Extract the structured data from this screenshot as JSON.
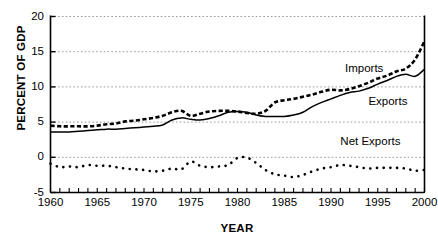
{
  "chart_data": {
    "type": "line",
    "title": "",
    "xlabel": "YEAR",
    "ylabel": "PERCENT OF GDP",
    "xlim": [
      1960,
      2000
    ],
    "ylim": [
      -5,
      20
    ],
    "yticks": [
      20,
      15,
      10,
      5,
      0,
      -5
    ],
    "xticks": [
      1960,
      1965,
      1970,
      1975,
      1980,
      1985,
      1990,
      1995,
      2000
    ],
    "xtick_labels": [
      "1960",
      "1965",
      "1970",
      "1975",
      "1980",
      "1985",
      "1990",
      "1995",
      "2000"
    ],
    "ytick_labels": [
      "20",
      "15",
      "10",
      "5",
      "0",
      "-5"
    ],
    "grid": "horizontal-dotted",
    "legend_position": "inline-annotations",
    "minor_tick_interval": 1,
    "x": [
      1960,
      1961,
      1962,
      1963,
      1964,
      1965,
      1966,
      1967,
      1968,
      1969,
      1970,
      1971,
      1972,
      1973,
      1974,
      1975,
      1976,
      1977,
      1978,
      1979,
      1980,
      1981,
      1982,
      1983,
      1984,
      1985,
      1986,
      1987,
      1988,
      1989,
      1990,
      1991,
      1992,
      1993,
      1994,
      1995,
      1996,
      1997,
      1998,
      1999,
      2000
    ],
    "series": [
      {
        "name": "Imports",
        "style": "dashed",
        "color": "#000000",
        "values": [
          4.5,
          4.4,
          4.4,
          4.4,
          4.4,
          4.5,
          4.7,
          4.8,
          5.1,
          5.2,
          5.4,
          5.6,
          5.9,
          6.4,
          6.6,
          5.9,
          6.2,
          6.5,
          6.6,
          6.6,
          6.5,
          6.3,
          6.2,
          6.6,
          7.8,
          8.1,
          8.3,
          8.6,
          8.9,
          9.3,
          9.6,
          9.5,
          9.7,
          10.1,
          10.6,
          11.2,
          11.6,
          12.2,
          12.6,
          13.9,
          16.5
        ]
      },
      {
        "name": "Exports",
        "style": "solid",
        "color": "#000000",
        "values": [
          3.6,
          3.6,
          3.6,
          3.7,
          3.8,
          3.9,
          4.0,
          4.0,
          4.1,
          4.2,
          4.3,
          4.4,
          4.6,
          5.3,
          5.6,
          5.4,
          5.3,
          5.5,
          5.9,
          6.4,
          6.5,
          6.4,
          6.0,
          5.8,
          5.8,
          5.8,
          6.0,
          6.4,
          7.2,
          7.8,
          8.3,
          8.8,
          9.2,
          9.4,
          9.8,
          10.4,
          10.9,
          11.5,
          11.8,
          11.5,
          12.5
        ]
      },
      {
        "name": "Net Exports",
        "style": "dotted",
        "color": "#000000",
        "values": [
          -0.9,
          -1.4,
          -1.3,
          -1.4,
          -1.1,
          -1.2,
          -1.2,
          -1.4,
          -1.6,
          -1.7,
          -1.8,
          -2.0,
          -1.9,
          -1.6,
          -1.7,
          -0.6,
          -1.2,
          -1.4,
          -1.3,
          -1.1,
          -0.1,
          -0.05,
          -0.8,
          -1.8,
          -2.4,
          -2.6,
          -2.8,
          -2.5,
          -2.0,
          -1.6,
          -1.4,
          -1.1,
          -1.2,
          -1.4,
          -1.6,
          -1.5,
          -1.5,
          -1.5,
          -1.6,
          -1.9,
          -1.8
        ]
      }
    ],
    "annotations": [
      {
        "text": "Imports",
        "x": 1991.5,
        "y": 12.7
      },
      {
        "text": "Exports",
        "x": 1994.0,
        "y": 8.0
      },
      {
        "text": "Net Exports",
        "x": 1991.0,
        "y": 2.3
      }
    ],
    "axis_color": "#000000",
    "grid_color": "#9a9a9a",
    "background": "#ffffff"
  }
}
